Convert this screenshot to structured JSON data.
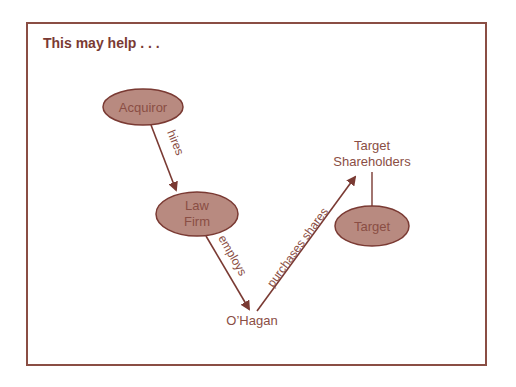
{
  "title": "This may help . . .",
  "colors": {
    "frame": "#8a4e44",
    "node_fill": "#b88a80",
    "node_stroke": "#7a3a33",
    "text": "#8a4e44",
    "arrow": "#7a3a33"
  },
  "nodes": {
    "acquiror": {
      "label": "Acquiror"
    },
    "law_firm": {
      "line1": "Law",
      "line2": "Firm"
    },
    "target": {
      "label": "Target"
    },
    "target_shareholders": {
      "line1": "Target",
      "line2": "Shareholders"
    },
    "ohagan": {
      "label": "O’Hagan"
    }
  },
  "edges": {
    "hires": "hires",
    "employs": "employs",
    "purchases_shares": "purchases shares"
  }
}
